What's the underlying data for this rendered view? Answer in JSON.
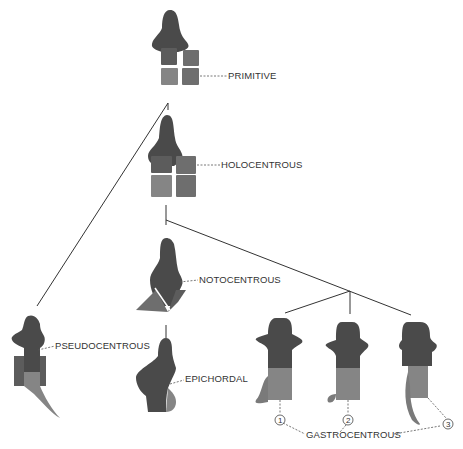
{
  "diagram": {
    "type": "phylogenetic vertebra types",
    "colors": {
      "neural_arch": "#4a4a4a",
      "interdorsal": "#5c5c5c",
      "pleurocentrum": "#6e6e6e",
      "intercentrum": "#858585",
      "background": "#ffffff"
    },
    "nodes": [
      {
        "id": "primitive",
        "label": "PRIMITIVE"
      },
      {
        "id": "holocentrous",
        "label": "HOLOCENTROUS"
      },
      {
        "id": "notocentrous",
        "label": "NOTOCENTROUS"
      },
      {
        "id": "pseudocentrous",
        "label": "PSEUDOCENTROUS"
      },
      {
        "id": "epichordal",
        "label": "EPICHORDAL"
      },
      {
        "id": "gastrocentrous",
        "label": "GASTROCENTROUS",
        "variants": [
          "1",
          "2",
          "3"
        ]
      }
    ],
    "edges": [
      [
        "primitive",
        "holocentrous"
      ],
      [
        "primitive",
        "pseudocentrous"
      ],
      [
        "holocentrous",
        "notocentrous"
      ],
      [
        "holocentrous",
        "gastrocentrous"
      ],
      [
        "notocentrous",
        "epichordal"
      ]
    ]
  }
}
